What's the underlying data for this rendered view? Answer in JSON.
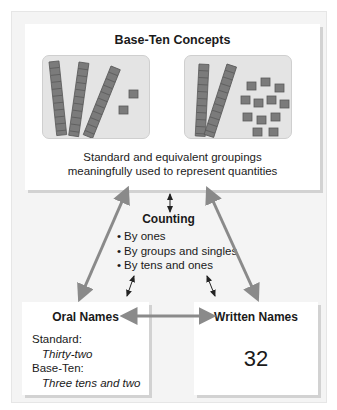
{
  "diagram": {
    "title": "Base-Ten Concepts",
    "panels": [
      {
        "name": "three-tens-two-ones",
        "tens_rods": 3,
        "unit_cubes": 2
      },
      {
        "name": "two-tens-twelve-ones",
        "tens_rods": 2,
        "unit_cubes": 12
      }
    ],
    "caption_line1": "Standard and equivalent groupings",
    "caption_line2": "meaningfully used to represent quantities",
    "counting": {
      "title": "Counting",
      "items": [
        "By ones",
        "By groups and singles",
        "By tens and ones"
      ]
    },
    "oral_names": {
      "title": "Oral Names",
      "standard_label": "Standard:",
      "standard_value": "Thirty-two",
      "base_ten_label": "Base-Ten:",
      "base_ten_value": "Three tens and two"
    },
    "written_names": {
      "title": "Written Names",
      "value": "32"
    },
    "colors": {
      "frame_bg": "#f4f4f4",
      "box_bg": "#ffffff",
      "arrow": "#8a8a8a",
      "block": "#7a7a7a",
      "panel_bg": "#e4e4e4"
    }
  }
}
